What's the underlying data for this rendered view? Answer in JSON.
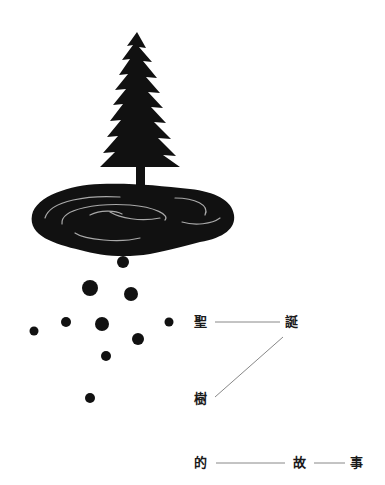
{
  "title_chars": [
    "聖",
    "誕",
    "樹",
    "的",
    "故",
    "事"
  ],
  "colors": {
    "ink": "#111111",
    "line": "#888888",
    "background": "#ffffff",
    "highlight": "#cfcfcf"
  },
  "illustration": {
    "subject": "christmas-tree-with-puddle-and-falling-drops",
    "drop_count": 10
  }
}
